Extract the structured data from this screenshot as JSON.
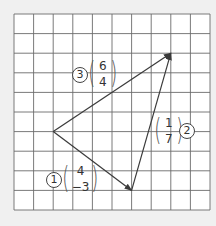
{
  "diagram": {
    "type": "vector-triangle-on-grid",
    "grid": {
      "cols": 10,
      "rows": 10,
      "left": 14,
      "top": 14,
      "cell": 19.6,
      "line_color": "#6b6b6b",
      "background": "#ffffff"
    },
    "points": {
      "A": {
        "col": 2,
        "row": 6
      },
      "B": {
        "col": 6,
        "row": 9
      },
      "C": {
        "col": 8,
        "row": 2
      }
    },
    "vectors": [
      {
        "id": "1",
        "from": "A",
        "to": "B",
        "label_number": "1",
        "top": "4",
        "bottom": "-3"
      },
      {
        "id": "2",
        "from": "B",
        "to": "C",
        "label_number": "2",
        "top": "1",
        "bottom": "7"
      },
      {
        "id": "3",
        "from": "A",
        "to": "C",
        "label_number": "3",
        "top": "6",
        "bottom": "4"
      }
    ],
    "arrow_color": "#3a3a3a"
  },
  "labels": {
    "v1": {
      "number": "1",
      "top": "4",
      "bottom": "−3"
    },
    "v2": {
      "number": "2",
      "top": "1",
      "bottom": "7"
    },
    "v3": {
      "number": "3",
      "top": "6",
      "bottom": "4"
    }
  }
}
